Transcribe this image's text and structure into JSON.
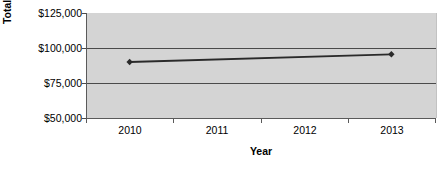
{
  "chart_data": {
    "type": "line",
    "title": "",
    "xlabel": "Year",
    "ylabel": "Total Compensation",
    "categories": [
      "2010",
      "2011",
      "2012",
      "2013"
    ],
    "series": [
      {
        "name": "Total Compensation",
        "values": [
          90000,
          null,
          null,
          95500
        ],
        "marker": "diamond",
        "color": "#2a2a2a"
      }
    ],
    "ylim": [
      50000,
      125000
    ],
    "ytick_values": [
      125000,
      100000,
      75000,
      50000
    ],
    "ytick_labels": [
      "$125,000",
      "$100,000",
      "$75,000",
      "$50,000"
    ],
    "gridlines": [
      "$100,000",
      "$75,000"
    ],
    "grid": true,
    "legend": "none",
    "plot_background": "#d4d4d4",
    "axis_color": "#4a4a4a"
  },
  "axes": {
    "y_title": "Total Compensation",
    "x_title": "Year"
  }
}
